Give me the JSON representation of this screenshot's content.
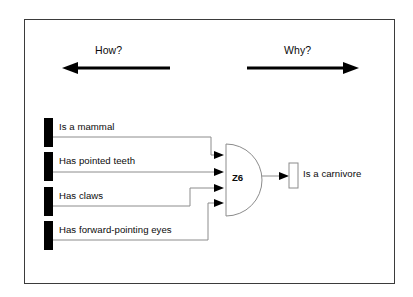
{
  "diagram": {
    "type": "inference-and-gate",
    "direction_annotations": [
      {
        "id": "how",
        "label": "How?",
        "arrow": "left"
      },
      {
        "id": "why",
        "label": "Why?",
        "arrow": "right"
      }
    ],
    "inputs": [
      {
        "id": "mammal",
        "label": "Is a mammal"
      },
      {
        "id": "pointed-teeth",
        "label": "Has pointed teeth"
      },
      {
        "id": "claws",
        "label": "Has claws"
      },
      {
        "id": "eyes",
        "label": "Has forward-pointing eyes"
      }
    ],
    "gate": {
      "id": "z6",
      "label": "Z6",
      "kind": "AND"
    },
    "output": {
      "id": "carnivore",
      "label": "Is a carnivore"
    },
    "colors": {
      "frame": "#3b3b3b",
      "input_bar": "#000000",
      "wire": "#8c8c8c",
      "gate_outline": "#8c8c8c",
      "arrow": "#000000",
      "text": "#0b0b0b",
      "background": "#ffffff"
    }
  }
}
